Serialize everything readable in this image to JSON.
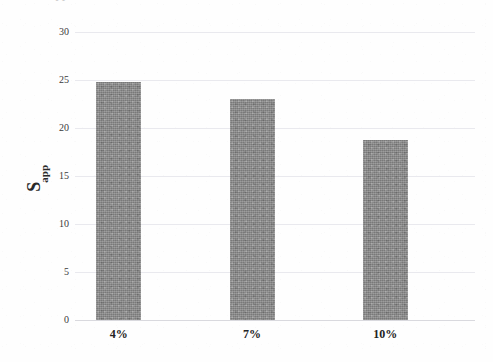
{
  "page": {
    "top_cropped_fragment": "S    app"
  },
  "chart_data": {
    "type": "bar",
    "title": "",
    "subtitle": "",
    "xlabel": "",
    "ylabel": "S_app",
    "ylabel_base": "S",
    "ylabel_subscript": "app",
    "categories": [
      "4%",
      "7%",
      "10%"
    ],
    "values": [
      24.8,
      23.0,
      18.8
    ],
    "series": [
      {
        "name": "S_app",
        "values": [
          24.8,
          23.0,
          18.8
        ]
      }
    ],
    "ylim": [
      0,
      30
    ],
    "xlim": [
      0,
      3
    ],
    "ytick_labels": [
      "0",
      "5",
      "10",
      "15",
      "20",
      "25",
      "30"
    ],
    "ytick_values": [
      0,
      5,
      10,
      15,
      20,
      25,
      30
    ],
    "ytick_interval": 5,
    "grid": true,
    "grid_axis": "y",
    "legend": false,
    "legend_position": "none",
    "bar_color": "#8a8a8a",
    "grid_color": "#e9e9ee",
    "baseline_color": "#d9d9de",
    "text_color": "#2b2b2b",
    "background_color": "#ffffff",
    "annotations": []
  }
}
